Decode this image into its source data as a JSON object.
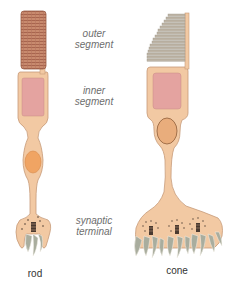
{
  "labels": {
    "outer_segment": [
      "outer",
      "segment"
    ],
    "inner_segment": [
      "inner",
      "segment"
    ],
    "synaptic_terminal": [
      "synaptic",
      "terminal"
    ]
  },
  "captions": {
    "rod": "rod",
    "cone": "cone"
  },
  "colors": {
    "cell_body": "#f2c9a3",
    "cell_outline": "#c79a78",
    "outer_segment_rod": "#c88a6e",
    "outer_segment_stripe": "#a8654e",
    "inner_segment": "#e4a3a0",
    "nucleus_rod": "#f0a463",
    "nucleus_cone": "#e9ad7c",
    "cone_lamellae": "#bdb4a6",
    "synapse_process": "#a9ad9e",
    "vesicle": "#4a3a30",
    "label_text": "#6e6e6e",
    "caption_text": "#333333"
  }
}
